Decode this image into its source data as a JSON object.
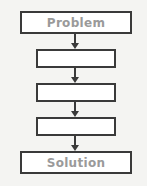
{
  "diagram": {
    "type": "flowchart",
    "steps": [
      {
        "label": "Problem"
      },
      {
        "label": ""
      },
      {
        "label": ""
      },
      {
        "label": ""
      },
      {
        "label": "Solution"
      }
    ],
    "colors": {
      "border": "#3a3a3a",
      "text": "#9a9a9a",
      "box_fill": "#ffffff",
      "background": "#f4f4f2"
    }
  }
}
